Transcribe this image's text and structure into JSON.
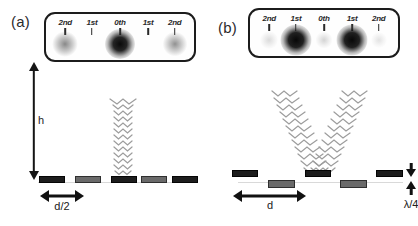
{
  "figure": {
    "panels": [
      {
        "id": "a",
        "letter": "(a)",
        "screen": {
          "orders": [
            {
              "label": "2nd",
              "x_pct": 13,
              "intensity": 0.45
            },
            {
              "label": "1st",
              "x_pct": 31,
              "intensity": 0.0
            },
            {
              "label": "0th",
              "x_pct": 50,
              "intensity": 1.0
            },
            {
              "label": "1st",
              "x_pct": 69,
              "intensity": 0.0
            },
            {
              "label": "2nd",
              "x_pct": 87,
              "intensity": 0.42
            }
          ]
        },
        "height_arrow": {
          "label": "h"
        },
        "beam": {
          "type": "single-vertical",
          "label": ""
        },
        "grating": {
          "bars": [
            {
              "shade": "dark",
              "level": "top"
            },
            {
              "shade": "gray",
              "level": "top"
            },
            {
              "shade": "dark",
              "level": "top"
            },
            {
              "shade": "gray",
              "level": "top"
            },
            {
              "shade": "dark",
              "level": "top"
            }
          ],
          "measure": {
            "label": "d/2"
          }
        }
      },
      {
        "id": "b",
        "letter": "(b)",
        "screen": {
          "orders": [
            {
              "label": "2nd",
              "x_pct": 13,
              "intensity": 0.16
            },
            {
              "label": "1st",
              "x_pct": 31,
              "intensity": 1.0
            },
            {
              "label": "0th",
              "x_pct": 50,
              "intensity": 0.18
            },
            {
              "label": "1st",
              "x_pct": 69,
              "intensity": 1.0
            },
            {
              "label": "2nd",
              "x_pct": 87,
              "intensity": 0.12
            }
          ]
        },
        "beam": {
          "type": "split-v",
          "label": ""
        },
        "grating": {
          "bars": [
            {
              "shade": "dark",
              "level": "top"
            },
            {
              "shade": "gray",
              "level": "bottom"
            },
            {
              "shade": "dark",
              "level": "top"
            },
            {
              "shade": "gray",
              "level": "bottom"
            },
            {
              "shade": "dark",
              "level": "top"
            }
          ],
          "measure": {
            "label": "d"
          },
          "step_measure": {
            "label": "λ/4"
          }
        }
      }
    ]
  },
  "colors": {
    "ink": "#1a1a1a",
    "bar_dark": "#1d1d1d",
    "bar_gray": "#6a6a6a",
    "wave": "#9a9a9a",
    "box_border": "#1c1c1c"
  }
}
